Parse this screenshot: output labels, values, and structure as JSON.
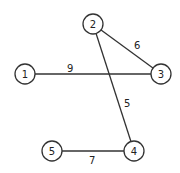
{
  "diagram": {
    "type": "weighted-undirected-graph",
    "nodes": [
      {
        "id": "1",
        "label": "1",
        "x": 25,
        "y": 74
      },
      {
        "id": "2",
        "label": "2",
        "x": 93,
        "y": 24
      },
      {
        "id": "3",
        "label": "3",
        "x": 161,
        "y": 74
      },
      {
        "id": "4",
        "label": "4",
        "x": 134,
        "y": 151
      },
      {
        "id": "5",
        "label": "5",
        "x": 52,
        "y": 151
      }
    ],
    "edges": [
      {
        "from": "1",
        "to": "3",
        "weight": "9",
        "lx": 67,
        "ly": 72
      },
      {
        "from": "2",
        "to": "3",
        "weight": "6",
        "lx": 134,
        "ly": 49
      },
      {
        "from": "2",
        "to": "4",
        "weight": "5",
        "lx": 124,
        "ly": 107
      },
      {
        "from": "5",
        "to": "4",
        "weight": "7",
        "lx": 89,
        "ly": 164
      }
    ]
  }
}
